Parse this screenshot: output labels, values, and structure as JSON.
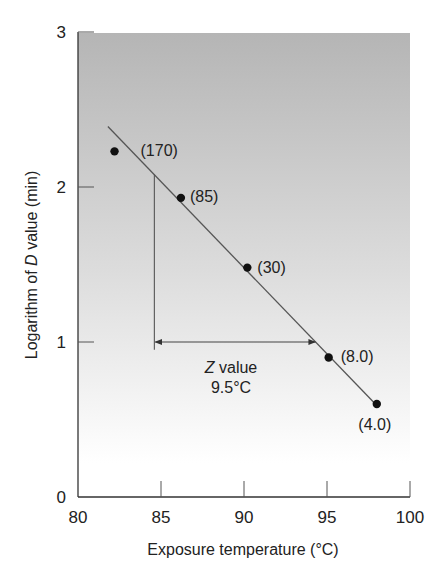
{
  "chart_data": {
    "type": "scatter",
    "title": "",
    "xlabel": "Exposure temperature (°C)",
    "ylabel_parts": [
      "Logarithm of ",
      "D",
      " value (min)"
    ],
    "ylabel": "Logarithm of D value (min)",
    "xlim": [
      80,
      100
    ],
    "ylim": [
      0,
      3
    ],
    "x_ticks": [
      80,
      85,
      90,
      95,
      100
    ],
    "y_ticks": [
      0,
      1,
      2,
      3
    ],
    "grid": false,
    "legend": null,
    "background": {
      "gradient_top": "#b5b5b5",
      "gradient_bottom": "#ffffff"
    },
    "points": [
      {
        "x": 82.2,
        "y": 2.23,
        "label": "(170)",
        "d_value_min": 170
      },
      {
        "x": 86.2,
        "y": 1.93,
        "label": "(85)",
        "d_value_min": 85
      },
      {
        "x": 90.2,
        "y": 1.48,
        "label": "(30)",
        "d_value_min": 30
      },
      {
        "x": 95.1,
        "y": 0.9,
        "label": "(8.0)",
        "d_value_min": 8.0
      },
      {
        "x": 98.0,
        "y": 0.6,
        "label": "(4.0)",
        "d_value_min": 4.0
      }
    ],
    "fit_line": {
      "x_start": 81.8,
      "y_start": 2.39,
      "x_end": 98.0,
      "y_end": 0.59
    },
    "annotations": {
      "z_value": {
        "title_italic": "Z",
        "title_rest": " value",
        "value": "9.5°C",
        "vertical_line": {
          "x": 84.6,
          "y_top": 2.08,
          "y_bottom": 0.95
        },
        "arrow": {
          "x_start": 84.6,
          "x_end": 94.3,
          "y": 1.0
        }
      }
    }
  }
}
